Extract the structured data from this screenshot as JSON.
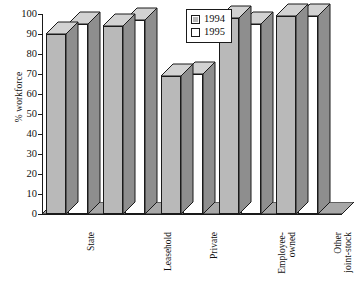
{
  "chart_data": {
    "type": "bar",
    "title": "",
    "subtitle": "",
    "xlabel": "",
    "ylabel": "% workforce",
    "ylim": [
      0,
      100
    ],
    "yticks": [
      0,
      10,
      20,
      30,
      40,
      50,
      60,
      70,
      80,
      90,
      100
    ],
    "grid": false,
    "legend_position": "top-center",
    "style": "3d-bar",
    "categories": [
      "State",
      "Leasehold",
      "Private",
      "Employee-\nowned",
      "Other\njoint-stock"
    ],
    "series": [
      {
        "name": "1994",
        "color": "#b9b9b9",
        "values": [
          90,
          94,
          69,
          98,
          99
        ]
      },
      {
        "name": "1995",
        "color": "#ffffff",
        "values": [
          95,
          97,
          70,
          95,
          99
        ]
      }
    ]
  },
  "legend": {
    "entries": [
      {
        "label": "1994",
        "swatch": "#b9b9b9"
      },
      {
        "label": "1995",
        "swatch": "#ffffff"
      }
    ]
  },
  "axes": {
    "y_title": "% workforce",
    "y_tick_labels": [
      "100",
      "90",
      "80",
      "70",
      "60",
      "50",
      "40",
      "30",
      "20",
      "10",
      "0"
    ],
    "x_tick_labels": [
      "State",
      "Leasehold",
      "Private",
      "Employee-\nowned",
      "Other\njoint-stock"
    ]
  },
  "colors": {
    "bar_1994_front": "#b9b9b9",
    "bar_1995_front": "#ffffff",
    "bar_side": "#8e8e8e",
    "bar_top": "#d2d2d2",
    "outline": "#1a1a1a",
    "floor": "#a8a8a8",
    "background": "#ffffff"
  }
}
